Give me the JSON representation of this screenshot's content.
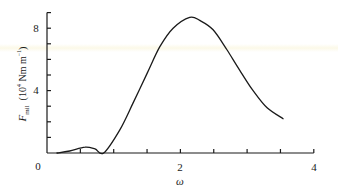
{
  "chart_data": {
    "type": "line",
    "title": "",
    "xlabel": "ω",
    "ylabel": "F_mil (10^4 Nm m^-1)",
    "ylabel_parts": {
      "symbol": "F",
      "subscript": "mil",
      "unit_prefix": "(10",
      "unit_exp": "4",
      "unit_mid": " Nm m",
      "unit_exp2": "−1",
      "unit_suffix": ")"
    },
    "xlim": [
      0,
      4
    ],
    "ylim": [
      0,
      9
    ],
    "x_ticks": [
      0,
      0.5,
      1,
      1.5,
      2,
      2.5,
      3,
      3.5,
      4
    ],
    "x_tick_labels": [
      {
        "value": 2,
        "label": "2"
      },
      {
        "value": 4,
        "label": "4"
      }
    ],
    "y_ticks": [
      0,
      1,
      2,
      3,
      4,
      5,
      6,
      7,
      8,
      9
    ],
    "y_tick_labels": [
      {
        "value": 0,
        "label": "0"
      },
      {
        "value": 4,
        "label": "4"
      },
      {
        "value": 8,
        "label": "8"
      }
    ],
    "grid": false,
    "legend": null,
    "series": [
      {
        "name": "F_mil",
        "color": "#1a1a1a",
        "x": [
          0.15,
          0.34,
          0.57,
          0.72,
          0.85,
          1.09,
          1.29,
          1.5,
          1.69,
          1.89,
          2.14,
          2.29,
          2.49,
          2.7,
          2.89,
          3.09,
          3.3,
          3.54
        ],
        "y": [
          0.0,
          0.13,
          0.38,
          0.26,
          0.0,
          1.47,
          3.2,
          5.1,
          6.8,
          8.0,
          8.7,
          8.5,
          7.9,
          6.6,
          5.3,
          4.0,
          2.9,
          2.2
        ]
      }
    ]
  },
  "labels": {
    "zero": "0",
    "x2": "2",
    "x4": "4",
    "y4": "4",
    "y8": "8",
    "xtitle": "ω"
  }
}
